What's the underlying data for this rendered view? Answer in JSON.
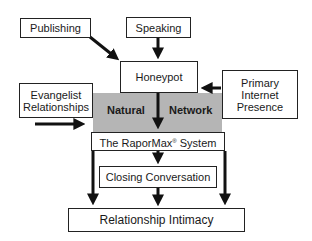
{
  "diagram": {
    "nodes": {
      "publishing": "Publishing",
      "speaking": "Speaking",
      "honeypot": "Honeypot",
      "evangelist": "Evangelist Relationships",
      "evangelist_line1": "Evangelist",
      "evangelist_line2": "Relationships",
      "primary_internet": "Primary Internet Presence",
      "primary_line1": "Primary",
      "primary_line2": "Internet",
      "primary_line3": "Presence",
      "raporMax_prefix": "The RaporMax",
      "raporMax_sup": "®",
      "raporMax_suffix": " System",
      "closing": "Closing Conversation",
      "intimacy": "Relationship Intimacy"
    },
    "region": {
      "label_left": "Natural",
      "label_right": "Network",
      "color": "#b5b5b5"
    },
    "edges": [
      {
        "from": "Publishing",
        "to": "Honeypot"
      },
      {
        "from": "Speaking",
        "to": "Honeypot"
      },
      {
        "from": "Primary Internet Presence",
        "to": "Honeypot"
      },
      {
        "from": "Honeypot",
        "to": "The RaporMax System"
      },
      {
        "from": "Evangelist Relationships",
        "to": "Natural Network"
      },
      {
        "from": "The RaporMax System",
        "to": "Closing Conversation"
      },
      {
        "from": "The RaporMax System",
        "to": "Relationship Intimacy (left)"
      },
      {
        "from": "The RaporMax System",
        "to": "Relationship Intimacy (right)"
      },
      {
        "from": "Closing Conversation",
        "to": "Relationship Intimacy"
      }
    ]
  }
}
